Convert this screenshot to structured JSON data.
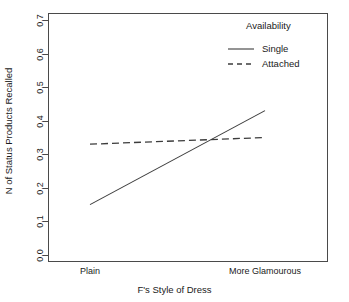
{
  "chart_data": {
    "type": "line",
    "title": "",
    "xlabel": "F's Style of Dress",
    "ylabel": "N of Status Products Recalled",
    "categories": [
      "Plain",
      "More Glamourous"
    ],
    "xtick_labels": [
      "Plain",
      "More Glamourous"
    ],
    "ytick_labels": [
      "0.0",
      "0.1",
      "0.2",
      "0.3",
      "0.4",
      "0.5",
      "0.6",
      "0.7"
    ],
    "ytick_values": [
      0.0,
      0.1,
      0.2,
      0.3,
      0.4,
      0.5,
      0.6,
      0.7
    ],
    "ylim": [
      0.0,
      0.7
    ],
    "xlim": [
      0,
      1
    ],
    "grid": false,
    "legend_position": "top-right",
    "legend_title": "Availability",
    "series": [
      {
        "name": "Single",
        "style": "solid",
        "color": "#3c3c3c",
        "values": [
          0.15,
          0.43
        ]
      },
      {
        "name": "Attached",
        "style": "dashed",
        "color": "#3c3c3c",
        "values": [
          0.33,
          0.35
        ]
      }
    ]
  },
  "axes": {
    "y_title": "N of Status Products Recalled",
    "x_title": "F's Style of Dress",
    "y_ticks": [
      "0.0",
      "0.1",
      "0.2",
      "0.3",
      "0.4",
      "0.5",
      "0.6",
      "0.7"
    ],
    "x_ticks": [
      "Plain",
      "More Glamourous"
    ]
  },
  "legend": {
    "title": "Availability",
    "entries": [
      {
        "label": "Single",
        "style": "solid"
      },
      {
        "label": "Attached",
        "style": "dashed"
      }
    ]
  },
  "title_remnant": ""
}
